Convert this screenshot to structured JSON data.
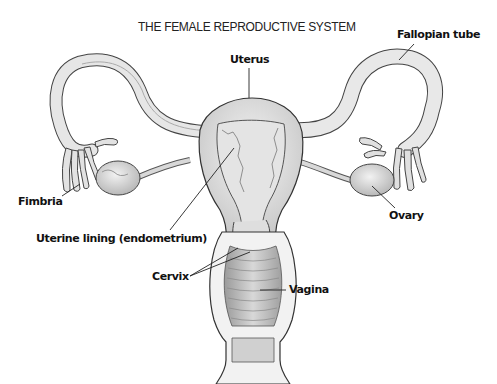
{
  "diagram": {
    "title": "THE FEMALE REPRODUCTIVE SYSTEM",
    "labels": {
      "fallopian_tube": "Fallopian tube",
      "uterus": "Uterus",
      "fimbria": "Fimbria",
      "ovary": "Ovary",
      "uterine_lining": "Uterine lining (endometrium)",
      "cervix": "Cervix",
      "vagina": "Vagina"
    },
    "colors": {
      "background": "#ffffff",
      "outline": "#333333",
      "tissue_light": "#ececec",
      "tissue_mid": "#d4d4d4",
      "tissue_dark": "#a8a8a8",
      "text": "#111111"
    }
  }
}
